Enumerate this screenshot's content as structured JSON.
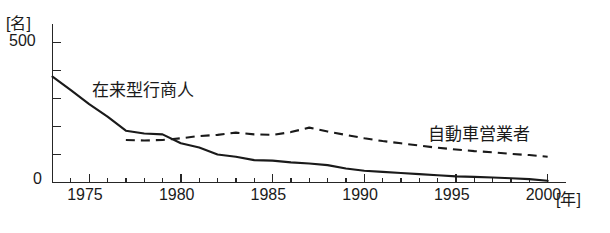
{
  "chart_data": {
    "type": "line",
    "title": "",
    "xlabel": "年",
    "ylabel": "名",
    "y_unit_label": "[名]",
    "x_unit_label": "[年]",
    "xlim": [
      1973,
      2001
    ],
    "ylim": [
      0,
      500
    ],
    "y_ticks": [
      0,
      100,
      200,
      300,
      400,
      500
    ],
    "y_tick_labels": [
      "0",
      "",
      "",
      "",
      "",
      "500"
    ],
    "x_ticks": [
      1973,
      1974,
      1975,
      1976,
      1977,
      1978,
      1979,
      1980,
      1981,
      1982,
      1983,
      1984,
      1985,
      1986,
      1987,
      1988,
      1989,
      1990,
      1991,
      1992,
      1993,
      1994,
      1995,
      1996,
      1997,
      1998,
      1999,
      2000
    ],
    "x_tick_labels": [
      "1975",
      "1980",
      "1985",
      "1990",
      "1995",
      "2000"
    ],
    "x_major_ticks": [
      1975,
      1980,
      1985,
      1990,
      1995,
      2000
    ],
    "grid": false,
    "legend_position": "inline-annotation",
    "series": [
      {
        "name": "在来型行商人",
        "style": "solid",
        "x": [
          1973,
          1974,
          1975,
          1976,
          1977,
          1978,
          1979,
          1980,
          1981,
          1982,
          1983,
          1984,
          1985,
          1986,
          1987,
          1988,
          1989,
          1990,
          1991,
          1992,
          1993,
          1994,
          1995,
          1996,
          1997,
          1998,
          1999,
          2000
        ],
        "values": [
          378,
          330,
          280,
          235,
          185,
          175,
          172,
          140,
          125,
          100,
          92,
          80,
          78,
          72,
          68,
          62,
          50,
          42,
          38,
          34,
          30,
          26,
          22,
          20,
          18,
          15,
          12,
          6
        ]
      },
      {
        "name": "自動車営業者",
        "style": "dashed",
        "x": [
          1977,
          1978,
          1979,
          1980,
          1981,
          1982,
          1983,
          1984,
          1985,
          1986,
          1987,
          1988,
          1989,
          1990,
          1991,
          1992,
          1993,
          1994,
          1995,
          1996,
          1997,
          1998,
          1999,
          2000
        ],
        "values": [
          152,
          150,
          152,
          158,
          166,
          170,
          178,
          172,
          170,
          180,
          196,
          182,
          170,
          158,
          148,
          140,
          132,
          124,
          118,
          112,
          108,
          102,
          98,
          92
        ]
      }
    ],
    "annotations": [
      {
        "text": "在来型行商人",
        "near_x": 1976,
        "near_y": 300
      },
      {
        "text": "自動車営業者",
        "near_x": 1994,
        "near_y": 210
      }
    ],
    "colors": {
      "line": "#1a1a1a",
      "axis": "#262626",
      "background": "#ffffff"
    }
  },
  "axis": {
    "y_unit": "[名]",
    "y_max_label": "500",
    "y_min_label": "0",
    "x_unit": "[年]"
  },
  "labels": {
    "series_solid": "在来型行商人",
    "series_dashed": "自動車営業者"
  },
  "x_labels": {
    "t1975": "1975",
    "t1980": "1980",
    "t1985": "1985",
    "t1990": "1990",
    "t1995": "1995",
    "t2000": "2000"
  }
}
